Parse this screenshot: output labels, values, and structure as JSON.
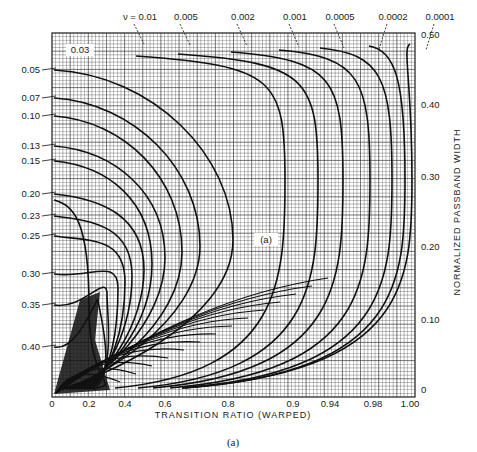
{
  "chart_data": {
    "type": "line",
    "title": "",
    "caption": "(a)",
    "inner_label": "(a)",
    "xlabel": "TRANSITION RATIO (WARPED)",
    "ylabel": "NORMALIZED PASSBAND WIDTH",
    "x_scale": "warped",
    "x_ticks": [
      {
        "label": "0",
        "value": 0,
        "px": 52
      },
      {
        "label": "0.2",
        "value": 0.2,
        "px": 89
      },
      {
        "label": "0.4",
        "value": 0.4,
        "px": 125
      },
      {
        "label": "0.6",
        "value": 0.6,
        "px": 165
      },
      {
        "label": "0.8",
        "value": 0.8,
        "px": 228
      },
      {
        "label": "0.9",
        "value": 0.9,
        "px": 293
      },
      {
        "label": "0.94",
        "value": 0.94,
        "px": 330
      },
      {
        "label": "0.98",
        "value": 0.98,
        "px": 373
      },
      {
        "label": "1.00",
        "value": 1.0,
        "px": 410
      }
    ],
    "y_ticks": [
      {
        "label": "0.50",
        "value": 0.5,
        "px": 35
      },
      {
        "label": "0.40",
        "value": 0.4,
        "px": 105
      },
      {
        "label": "0.30",
        "value": 0.3,
        "px": 177
      },
      {
        "label": "0.20",
        "value": 0.2,
        "px": 247
      },
      {
        "label": "0.10",
        "value": 0.1,
        "px": 320
      },
      {
        "label": "0",
        "value": 0,
        "px": 390
      }
    ],
    "ylim": [
      0,
      0.5
    ],
    "xlim": [
      0,
      1.0
    ],
    "grid": true,
    "legend_position": "curve labels on top and left edges",
    "top_curve_labels": [
      {
        "label": "ν = 0.01",
        "px": 140
      },
      {
        "label": "0.005",
        "px": 186
      },
      {
        "label": "0.002",
        "px": 243
      },
      {
        "label": "0.001",
        "px": 295
      },
      {
        "label": "0.0005",
        "px": 340
      },
      {
        "label": "0.0002",
        "px": 393
      },
      {
        "label": "0.0001",
        "px": 440
      }
    ],
    "inner_curve_label": {
      "label": "0.03",
      "x": 80,
      "y": 50
    },
    "left_curve_labels": [
      {
        "label": "0.05",
        "py": 70
      },
      {
        "label": "0.07",
        "py": 98
      },
      {
        "label": "0.10",
        "py": 116
      },
      {
        "label": "0.13",
        "py": 146
      },
      {
        "label": "0.15",
        "py": 161
      },
      {
        "label": "0.20",
        "py": 194
      },
      {
        "label": "0.23",
        "py": 216
      },
      {
        "label": "0.25",
        "py": 236
      },
      {
        "label": "0.30",
        "py": 274
      },
      {
        "label": "0.35",
        "py": 305
      },
      {
        "label": "0.40",
        "py": 347
      }
    ],
    "series": [
      {
        "name": "0.0001",
        "x_right": 0.999,
        "px_right": 412,
        "shape": "near-vertical at right edge"
      },
      {
        "name": "0.0002",
        "x_right": 0.995,
        "px_right": 405
      },
      {
        "name": "0.0005",
        "x_right": 0.985,
        "px_right": 392
      },
      {
        "name": "0.001",
        "x_right": 0.97,
        "px_right": 370
      },
      {
        "name": "0.002",
        "x_right": 0.95,
        "px_right": 343
      },
      {
        "name": "0.005",
        "x_right": 0.92,
        "px_right": 318
      },
      {
        "name": "0.01",
        "x_right": 0.89,
        "px_right": 285
      },
      {
        "name": "0.03",
        "x_right": 0.8,
        "px_right": 233
      },
      {
        "name": "0.05",
        "x_right": 0.72,
        "px_right": 200
      },
      {
        "name": "0.07",
        "x_right": 0.66,
        "px_right": 182
      },
      {
        "name": "0.10",
        "x_right": 0.6,
        "px_right": 165
      },
      {
        "name": "0.13",
        "x_right": 0.54,
        "px_right": 152
      },
      {
        "name": "0.15",
        "x_right": 0.5,
        "px_right": 144
      },
      {
        "name": "0.20",
        "x_right": 0.44,
        "px_right": 132
      },
      {
        "name": "0.23",
        "x_right": 0.4,
        "px_right": 125
      },
      {
        "name": "0.25",
        "x_right": 0.36,
        "px_right": 118
      },
      {
        "name": "0.30",
        "x_right": 0.3,
        "px_right": 107
      },
      {
        "name": "0.35",
        "x_right": 0.25,
        "px_right": 98
      },
      {
        "name": "0.40",
        "x_right": 0.2,
        "px_right": 89
      }
    ],
    "plot_box": {
      "left": 52,
      "top": 33,
      "right": 415,
      "bottom": 397
    }
  }
}
